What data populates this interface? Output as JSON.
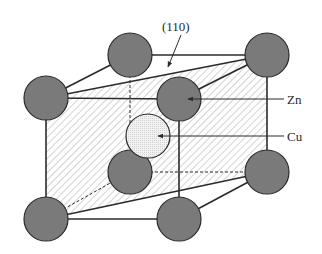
{
  "figure": {
    "type": "crystal-structure-diagram",
    "colors": {
      "background": "#ffffff",
      "line": "#2b2b2b",
      "zn_atom_fill": "#7a7a7a",
      "cu_atom_fill": "#ececec",
      "hatch": "#a8a8a8"
    }
  },
  "labels": {
    "plane": "(110)",
    "zn": "Zn",
    "cu": "Cu"
  },
  "atoms": {
    "zn_count": 8,
    "cu_count": 1
  }
}
